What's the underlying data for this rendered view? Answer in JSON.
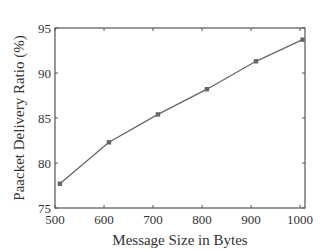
{
  "chart_data": {
    "type": "line",
    "title": "",
    "xlabel": "Message Size in Bytes",
    "ylabel": "Paacket Delivery Ratio (%)",
    "x": [
      510,
      610,
      710,
      810,
      910,
      1005
    ],
    "series": [
      {
        "name": "Packet Delivery Ratio",
        "values": [
          77.7,
          82.3,
          85.4,
          88.2,
          91.3,
          93.7
        ],
        "marker": "square",
        "color": "#666666"
      }
    ],
    "xlim": [
      500,
      1010
    ],
    "ylim": [
      75,
      95
    ],
    "xticks": [
      500,
      600,
      700,
      800,
      900,
      1000
    ],
    "yticks": [
      75,
      80,
      85,
      90,
      95
    ],
    "grid": false,
    "legend": null
  },
  "labels": {
    "xlabel": "Message Size in Bytes",
    "ylabel": "Paacket Delivery Ratio (%)"
  }
}
